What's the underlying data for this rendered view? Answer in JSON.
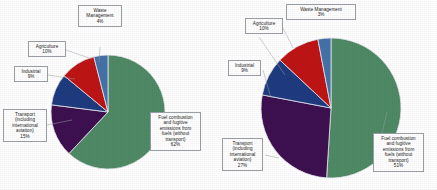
{
  "figure": {
    "background": "#ffffff",
    "panels": [
      "left",
      "right"
    ]
  },
  "palette": {
    "fuel": "#4F8A66",
    "transport": "#3D1050",
    "industrial": "#1F3B80",
    "agriculture": "#BE1414",
    "waste": "#4472A8",
    "slice_border": "#E8E8F0",
    "callout_border": "#9AA0A6",
    "text": "#1A1A1A"
  },
  "chart_data": [
    {
      "type": "pie",
      "title": "",
      "name": "left-pie",
      "categories": [
        "Fuel combustion and fugitive emissions from fuels (without transport)",
        "Transport (including international aviation)",
        "Industrial",
        "Agriculture",
        "Waste Management"
      ],
      "values": [
        62,
        15,
        9,
        10,
        4
      ],
      "value_labels": [
        "62%",
        "15%",
        "9%",
        "10%",
        "4%"
      ],
      "colors": [
        "#4F8A66",
        "#3D1050",
        "#1F3B80",
        "#BE1414",
        "#4472A8"
      ],
      "start_angle_deg": 0,
      "direction": "clockwise",
      "legend": "callout-labels",
      "labels": [
        {
          "key": "fuel",
          "lines": [
            "Fuel combustion",
            "and fugitive",
            "emissions from",
            "fuels (without",
            "transport)"
          ],
          "pct": "62%"
        },
        {
          "key": "transport",
          "lines": [
            "Transport",
            "(including",
            "international",
            "aviation)"
          ],
          "pct": "15%"
        },
        {
          "key": "industrial",
          "lines": [
            "Industrial"
          ],
          "pct": "9%"
        },
        {
          "key": "agriculture",
          "lines": [
            "Agriculture"
          ],
          "pct": "10%"
        },
        {
          "key": "waste",
          "lines": [
            "Waste",
            "Management"
          ],
          "pct": "4%"
        }
      ]
    },
    {
      "type": "pie",
      "title": "",
      "name": "right-pie",
      "categories": [
        "Fuel combustion and fugitive emissions from fuels (without transport)",
        "Transport (including international aviation)",
        "Industrial",
        "Agriculture",
        "Waste Management"
      ],
      "values": [
        51,
        27,
        9,
        10,
        3
      ],
      "value_labels": [
        "51%",
        "27%",
        "9%",
        "10%",
        "3%"
      ],
      "colors": [
        "#4F8A66",
        "#3D1050",
        "#1F3B80",
        "#BE1414",
        "#4472A8"
      ],
      "start_angle_deg": 0,
      "direction": "clockwise",
      "legend": "callout-labels",
      "labels": [
        {
          "key": "fuel",
          "lines": [
            "Fuel combustion",
            "and fugitive",
            "emissions from",
            "fuels (without",
            "transport)"
          ],
          "pct": "51%"
        },
        {
          "key": "transport",
          "lines": [
            "Transport",
            "(including",
            "international",
            "aviation)"
          ],
          "pct": "27%"
        },
        {
          "key": "industrial",
          "lines": [
            "Industrial"
          ],
          "pct": "9%"
        },
        {
          "key": "agriculture",
          "lines": [
            "Agriculture"
          ],
          "pct": "10%"
        },
        {
          "key": "waste",
          "lines": [
            "Waste Management"
          ],
          "pct": "3%"
        }
      ]
    }
  ],
  "left": {
    "waste": {
      "l1": "Waste",
      "l2": "Management",
      "pct": "4%"
    },
    "agriculture": {
      "l1": "Agriculture",
      "pct": "10%"
    },
    "industrial": {
      "l1": "Industrial",
      "pct": "9%"
    },
    "transport": {
      "l1": "Transport",
      "l2": "(including",
      "l3": "international",
      "l4": "aviation)",
      "pct": "15%"
    },
    "fuel": {
      "l1": "Fuel combustion",
      "l2": "and fugitive",
      "l3": "emissions from",
      "l4": "fuels (without",
      "l5": "transport)",
      "pct": "62%"
    }
  },
  "right": {
    "waste": {
      "l1": "Waste Management",
      "pct": "3%"
    },
    "agriculture": {
      "l1": "Agriculture",
      "pct": "10%"
    },
    "industrial": {
      "l1": "Industrial",
      "pct": "9%"
    },
    "transport": {
      "l1": "Transport",
      "l2": "(including",
      "l3": "international",
      "l4": "aviation)",
      "pct": "27%"
    },
    "fuel": {
      "l1": "Fuel combustion",
      "l2": "and fugitive",
      "l3": "emissions from",
      "l4": "fuels (without",
      "l5": "transport)",
      "pct": "51%"
    }
  }
}
